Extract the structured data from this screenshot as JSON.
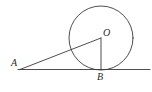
{
  "figure": {
    "background_color": "#ffffff",
    "stroke_color": "#3a3a3a",
    "label_color": "#2b2b2b",
    "width": 152,
    "height": 92
  },
  "labels": {
    "a": "A",
    "o": "O",
    "b": "B"
  },
  "geometry": {
    "circle": {
      "cx": 101,
      "cy": 38,
      "r": 32
    },
    "tangent_line": {
      "x1": 18,
      "y1": 69.5,
      "x2": 150,
      "y2": 69.5
    },
    "secant_line": {
      "x1": 20,
      "y1": 69.5,
      "x2": 101,
      "y2": 38
    },
    "radius_line": {
      "x1": 101,
      "y1": 38,
      "x2": 101,
      "y2": 69.5
    },
    "points": {
      "A": {
        "x": 20,
        "y": 69.5
      },
      "O": {
        "x": 101,
        "y": 38
      },
      "B": {
        "x": 101,
        "y": 69.5
      }
    }
  }
}
